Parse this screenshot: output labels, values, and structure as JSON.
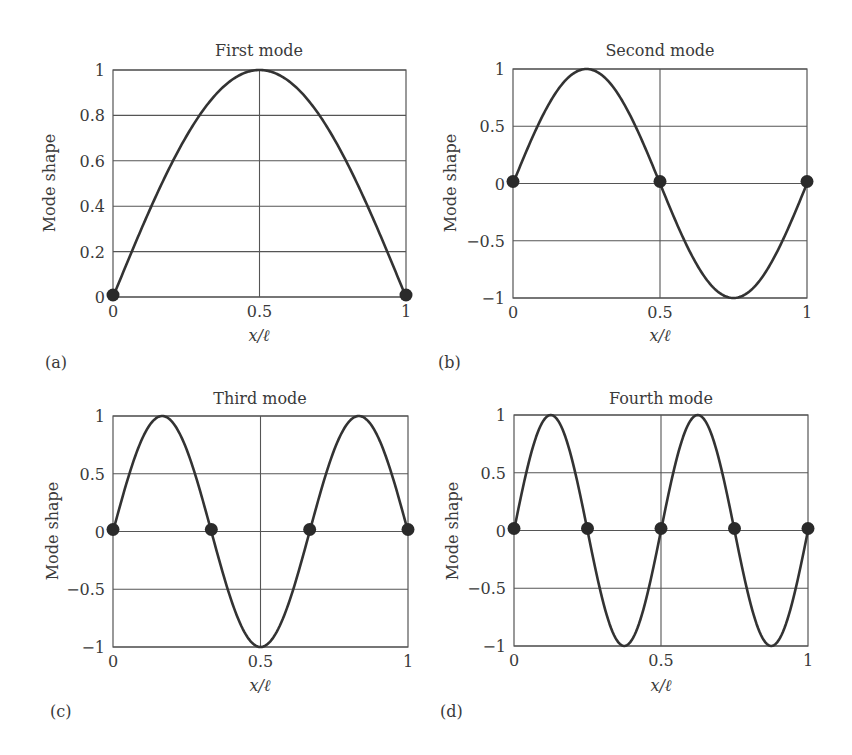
{
  "figure": {
    "panels": [
      {
        "tag": "(a)",
        "title": "First mode",
        "ylabel": "Mode shape",
        "xlabel": "x/ℓ"
      },
      {
        "tag": "(b)",
        "title": "Second mode",
        "ylabel": "Mode shape",
        "xlabel": "x/ℓ"
      },
      {
        "tag": "(c)",
        "title": "Third mode",
        "ylabel": "Mode shape",
        "xlabel": "x/ℓ"
      },
      {
        "tag": "(d)",
        "title": "Fourth mode",
        "ylabel": "Mode shape",
        "xlabel": "x/ℓ"
      }
    ],
    "colors": {
      "curve": "#333333",
      "grid": "#555555",
      "node": "#2a2a2a",
      "text": "#3a3a3a"
    }
  },
  "chart_data": [
    {
      "type": "line",
      "title": "First mode",
      "xlabel": "x/ℓ",
      "ylabel": "Mode shape",
      "function": "sin(1·π·x)",
      "mode": 1,
      "xlim": [
        0,
        1
      ],
      "ylim": [
        0,
        1
      ],
      "xticks": [
        "0",
        "0.5",
        "1"
      ],
      "yticks": [
        "0",
        "0.2",
        "0.4",
        "0.6",
        "0.8",
        "1"
      ],
      "grid": true,
      "x": [
        0,
        0.125,
        0.25,
        0.375,
        0.5,
        0.625,
        0.75,
        0.875,
        1
      ],
      "y": [
        0,
        0.383,
        0.707,
        0.924,
        1.0,
        0.924,
        0.707,
        0.383,
        0
      ],
      "nodes": [
        0,
        1
      ],
      "panel_tag": "(a)"
    },
    {
      "type": "line",
      "title": "Second mode",
      "xlabel": "x/ℓ",
      "ylabel": "Mode shape",
      "function": "sin(2·π·x)",
      "mode": 2,
      "xlim": [
        0,
        1
      ],
      "ylim": [
        -1,
        1
      ],
      "xticks": [
        "0",
        "0.5",
        "1"
      ],
      "yticks": [
        "−1",
        "−0.5",
        "0",
        "0.5",
        "1"
      ],
      "grid": true,
      "x": [
        0,
        0.125,
        0.25,
        0.375,
        0.5,
        0.625,
        0.75,
        0.875,
        1
      ],
      "y": [
        0,
        0.707,
        1.0,
        0.707,
        0,
        -0.707,
        -1.0,
        -0.707,
        0
      ],
      "nodes": [
        0,
        0.5,
        1
      ],
      "panel_tag": "(b)"
    },
    {
      "type": "line",
      "title": "Third mode",
      "xlabel": "x/ℓ",
      "ylabel": "Mode shape",
      "function": "sin(3·π·x)",
      "mode": 3,
      "xlim": [
        0,
        1
      ],
      "ylim": [
        -1,
        1
      ],
      "xticks": [
        "0",
        "0.5",
        "1"
      ],
      "yticks": [
        "−1",
        "−0.5",
        "0",
        "0.5",
        "1"
      ],
      "grid": true,
      "x": [
        0,
        0.1667,
        0.3333,
        0.5,
        0.6667,
        0.8333,
        1
      ],
      "y": [
        0,
        1.0,
        0,
        -1.0,
        0,
        1.0,
        0
      ],
      "nodes": [
        0,
        0.3333,
        0.6667,
        1
      ],
      "panel_tag": "(c)"
    },
    {
      "type": "line",
      "title": "Fourth mode",
      "xlabel": "x/ℓ",
      "ylabel": "Mode shape",
      "function": "sin(4·π·x)",
      "mode": 4,
      "xlim": [
        0,
        1
      ],
      "ylim": [
        -1,
        1
      ],
      "xticks": [
        "0",
        "0.5",
        "1"
      ],
      "yticks": [
        "−1",
        "−0.5",
        "0",
        "0.5",
        "1"
      ],
      "grid": true,
      "x": [
        0,
        0.125,
        0.25,
        0.375,
        0.5,
        0.625,
        0.75,
        0.875,
        1
      ],
      "y": [
        0,
        1.0,
        0,
        -1.0,
        0,
        1.0,
        0,
        -1.0,
        0
      ],
      "nodes": [
        0,
        0.25,
        0.5,
        0.75,
        1
      ],
      "panel_tag": "(d)"
    }
  ]
}
